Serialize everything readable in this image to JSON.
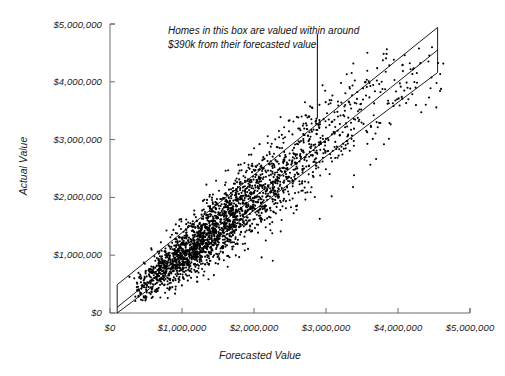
{
  "chart_data": {
    "type": "scatter",
    "title": "",
    "xlabel": "Forecasted Value",
    "ylabel": "Actual Value",
    "xlim": [
      0,
      5000000
    ],
    "ylim": [
      0,
      5000000
    ],
    "grid": false,
    "legend": null,
    "xticks": [
      0,
      1000000,
      2000000,
      3000000,
      4000000,
      5000000
    ],
    "xticklabels": [
      "$0",
      "$1,000,000",
      "$2,000,000",
      "$3,000,000",
      "$4,000,000",
      "$5,000,000"
    ],
    "yticks": [
      0,
      1000000,
      2000000,
      3000000,
      4000000,
      5000000
    ],
    "yticklabels": [
      "$0",
      "$1,000,000",
      "$2,000,000",
      "$3,000,000",
      "$4,000,000",
      "$5,000,000"
    ],
    "annotations": [
      {
        "text_line_1": "Homes in this box are valued within around",
        "text_line_2": "$390k from their forecasted value",
        "leader_from_x": 2880000,
        "leader_from_y": 4830000,
        "leader_to_x": 2880000,
        "leader_to_y": 3370000
      }
    ],
    "bands": {
      "description": "Parallelogram band of identity line plus/minus tolerance",
      "center_slope": 1,
      "center_intercept": 0,
      "tolerance": 390000,
      "x_start": 100000,
      "x_end": 4550000,
      "line_color": "#000000"
    },
    "point_color": "#000000",
    "point_size": 1.6,
    "n_points": 2500,
    "series": [
      {
        "name": "Homes",
        "x_center": 1700000,
        "y_center": 1700000,
        "correlation": 0.9,
        "spread": 700000,
        "residual_spread": 330000,
        "x_min": 150000,
        "x_max": 4650000,
        "y_min": 180000,
        "y_max": 4600000
      }
    ]
  },
  "figure": {
    "background": "#ffffff",
    "axis_color": "#6b6b6b"
  }
}
